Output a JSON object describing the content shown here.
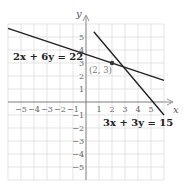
{
  "chart_data": {
    "type": "line",
    "title": "",
    "xlabel": "x",
    "ylabel": "y",
    "xlim": [
      -6,
      6
    ],
    "ylim": [
      -6,
      6
    ],
    "grid": true,
    "x_ticks": [
      "-5",
      "-4",
      "-3",
      "-2",
      "-1",
      "1",
      "2",
      "3",
      "4",
      "5"
    ],
    "y_ticks": [
      "5",
      "4",
      "3",
      "2",
      "1",
      "-1",
      "-2",
      "-3",
      "-4",
      "-5"
    ],
    "series": [
      {
        "name": "2x + 6y = 22",
        "equation": "2x + 6y = 22",
        "x": [
          -6,
          6
        ],
        "y": [
          5.67,
          1.67
        ]
      },
      {
        "name": "3x + 3y = 15",
        "equation": "3x + 3y = 15",
        "x": [
          0.6,
          6
        ],
        "y": [
          5.4,
          -1
        ]
      }
    ],
    "annotations": [
      {
        "text": "(2, 3)",
        "x": 2,
        "y": 3,
        "type": "intersection-point"
      }
    ]
  },
  "labels": {
    "eq1": "2x + 6y = 22",
    "eq2": "3x + 3y = 15",
    "point": "(2, 3)",
    "x_axis": "x",
    "y_axis": "y"
  },
  "colors": {
    "grid": "#d8d8d8",
    "axis": "#888888",
    "line": "#222222",
    "point": "#333333"
  }
}
